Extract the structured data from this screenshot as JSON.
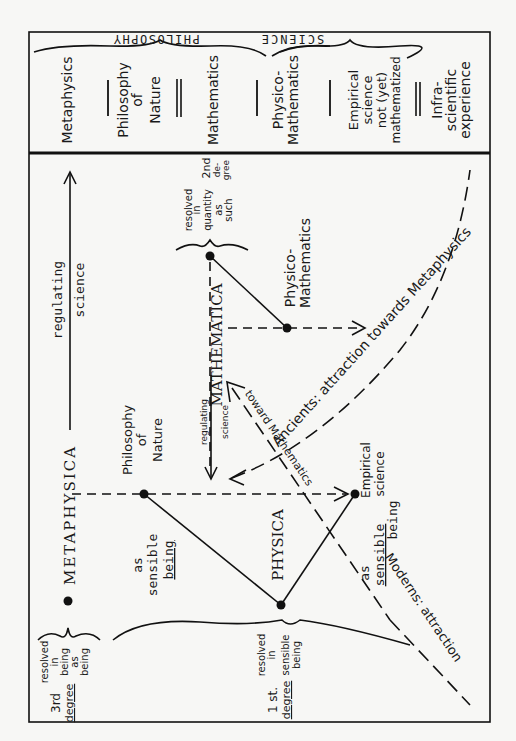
{
  "header": {
    "philosophy_label": "PHILOSOPHY",
    "science_label": "SCIENCE",
    "columns": [
      {
        "lines": [
          "Metaphysics"
        ]
      },
      {
        "lines": [
          "Philosophy",
          "of",
          "Nature"
        ]
      },
      {
        "lines": [
          "Mathematics"
        ]
      },
      {
        "lines": [
          "Physico-",
          "Mathematics"
        ]
      },
      {
        "lines": [
          "Empirical",
          "science",
          "not (yet)",
          "mathematized"
        ]
      },
      {
        "lines": [
          "Infra-",
          "scientific",
          "experience"
        ]
      }
    ]
  },
  "nodes": {
    "metaphysica": "METAPHYSICA",
    "mathematica": "MATHEMATICA",
    "physica": "PHYSICA",
    "philosophy_of_nature": [
      "Philosophy",
      "of",
      "Nature"
    ],
    "physico_mathematics": [
      "Physico-",
      "Mathematics"
    ],
    "empirical_science": [
      "Empirical",
      "science"
    ]
  },
  "labels": {
    "regulating_science_top": [
      "regulating",
      "science"
    ],
    "regulating_science_small": [
      "regulating",
      "science"
    ],
    "as_sensible_being_left": [
      "as",
      "sensible",
      "being"
    ],
    "as_sensible_being_right": [
      "as",
      "sensible",
      "being"
    ],
    "toward_mathematics": "toward Mathematics",
    "ancients": "Ancients: attraction towards Metaphysics",
    "moderns": "Moderns: attraction",
    "third_degree": [
      "3rd",
      "degree"
    ],
    "third_degree_desc": [
      "resolved",
      "in",
      "being",
      "as",
      "being"
    ],
    "first_degree": [
      "1 st.",
      "degree"
    ],
    "first_degree_desc": [
      "resolved",
      "in",
      "sensible",
      "being"
    ],
    "second_degree": [
      "2nd",
      "de-",
      "gree"
    ],
    "second_degree_desc": [
      "resolved",
      "in",
      "quantity",
      "as",
      "such"
    ]
  }
}
